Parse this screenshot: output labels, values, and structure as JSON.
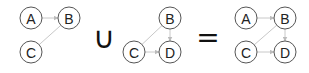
{
  "diagram": {
    "operators": {
      "union": "∪",
      "equals": "="
    },
    "graphs": [
      {
        "name": "graph-1",
        "nodes": [
          {
            "id": "A",
            "label": "A",
            "x": 31,
            "y": 18
          },
          {
            "id": "B",
            "label": "B",
            "x": 69,
            "y": 18
          },
          {
            "id": "C",
            "label": "C",
            "x": 31,
            "y": 52
          }
        ],
        "edges": [
          {
            "from": "A",
            "to": "B",
            "directed": true
          },
          {
            "from": "B",
            "to": "C",
            "directed": false
          }
        ]
      },
      {
        "name": "graph-2",
        "nodes": [
          {
            "id": "B",
            "label": "B",
            "x": 170,
            "y": 18
          },
          {
            "id": "C",
            "label": "C",
            "x": 134,
            "y": 52
          },
          {
            "id": "D",
            "label": "D",
            "x": 170,
            "y": 52
          }
        ],
        "edges": [
          {
            "from": "B",
            "to": "C",
            "directed": false
          },
          {
            "from": "B",
            "to": "D",
            "directed": true
          },
          {
            "from": "C",
            "to": "D",
            "directed": true
          }
        ]
      },
      {
        "name": "graph-result",
        "nodes": [
          {
            "id": "A",
            "label": "A",
            "x": 246,
            "y": 18
          },
          {
            "id": "B",
            "label": "B",
            "x": 285,
            "y": 18
          },
          {
            "id": "C",
            "label": "C",
            "x": 246,
            "y": 52
          },
          {
            "id": "D",
            "label": "D",
            "x": 285,
            "y": 52
          }
        ],
        "edges": [
          {
            "from": "A",
            "to": "B",
            "directed": true
          },
          {
            "from": "B",
            "to": "C",
            "directed": false
          },
          {
            "from": "B",
            "to": "D",
            "directed": true
          },
          {
            "from": "C",
            "to": "D",
            "directed": true
          }
        ]
      }
    ]
  }
}
